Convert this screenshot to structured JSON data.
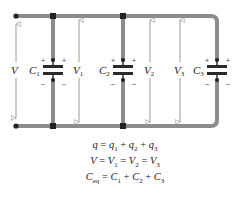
{
  "diagram": {
    "type": "parallel-capacitor-circuit",
    "colors": {
      "wire": "#8c8c8c",
      "capacitor_plate": "#2a2a2a",
      "node": "#222222",
      "arrow": "#9a9a9a",
      "text": "#222222"
    },
    "source": {
      "label": "V"
    },
    "capacitors": [
      {
        "name": "C",
        "sub": "1",
        "voltage_label": "V",
        "voltage_sub": "1",
        "plus": "+",
        "minus": "–"
      },
      {
        "name": "C",
        "sub": "2",
        "voltage_label": "V",
        "voltage_sub": "2",
        "plus": "+",
        "minus": "–"
      },
      {
        "name": "C",
        "sub": "3",
        "voltage_label": "V",
        "voltage_sub": "3",
        "plus": "+",
        "minus": "–"
      }
    ],
    "equations": [
      {
        "lhs": "q",
        "rhs": "q₁ + q₂ + q₃"
      },
      {
        "lhs": "V",
        "rhs": "V₁ = V₂ = V₃"
      },
      {
        "lhs": "C_eq",
        "rhs": "C₁ + C₂ + C₃"
      }
    ]
  }
}
